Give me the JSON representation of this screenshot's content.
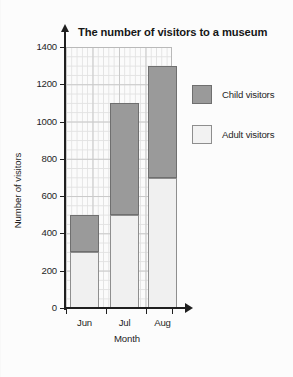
{
  "chart_data": {
    "type": "bar",
    "stacked": true,
    "title": "The number of visitors to a museum",
    "xlabel": "Month",
    "ylabel": "Number of visitors",
    "categories": [
      "Jun",
      "Jul",
      "Aug"
    ],
    "series": [
      {
        "name": "Adult visitors",
        "values": [
          300,
          500,
          700
        ],
        "color": "#f0f0f0"
      },
      {
        "name": "Child visitors",
        "values": [
          200,
          600,
          600
        ],
        "color": "#9a9a9a"
      }
    ],
    "totals": [
      500,
      1100,
      1300
    ],
    "ylim": [
      0,
      1400
    ],
    "ytick_values": [
      0,
      200,
      400,
      600,
      800,
      1000,
      1200,
      1400
    ],
    "ytick_labels": [
      "0",
      "200",
      "400",
      "600",
      "800",
      "1000",
      "1200",
      "1400"
    ],
    "grid": true,
    "grid_minor": true,
    "legend_position": "right",
    "legend": [
      {
        "label": "Child visitors",
        "swatch": "child-swatch"
      },
      {
        "label": "Adult visitors",
        "swatch": "adult-swatch"
      }
    ]
  },
  "axes": {
    "y_arrow_icon": "arrow-up-icon",
    "x_arrow_icon": "arrow-right-icon"
  }
}
